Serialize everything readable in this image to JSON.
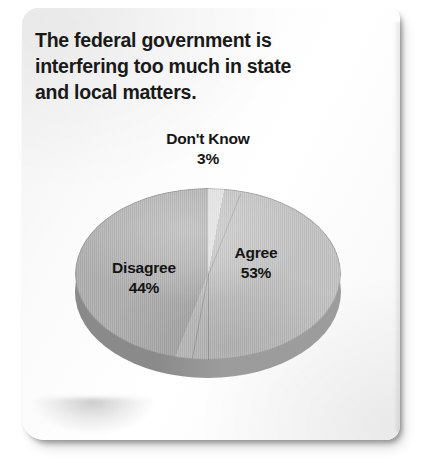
{
  "card": {
    "title_lines": [
      "The federal government is",
      "interfering too much in state",
      "and local matters."
    ]
  },
  "chart_data": {
    "type": "pie",
    "title": "The federal government is interfering too much in state and local matters.",
    "subtitle": "",
    "xlabel": "",
    "ylabel": "",
    "legend_position": "none",
    "grid": false,
    "three_d": true,
    "labels_inside": true,
    "categories": [
      "Don't Know",
      "Agree",
      "Disagree"
    ],
    "values": [
      3,
      53,
      44
    ],
    "value_suffix": "%",
    "slices": [
      {
        "name": "Don't Know",
        "label": "Don't Know",
        "value": 3,
        "value_label": "3%",
        "color": "#e2e2e2",
        "label_placement": "callout-above"
      },
      {
        "name": "Agree",
        "label": "Agree",
        "value": 53,
        "value_label": "53%",
        "color": "#c3c3c3",
        "label_placement": "inside-right"
      },
      {
        "name": "Disagree",
        "label": "Disagree",
        "value": 44,
        "value_label": "44%",
        "color": "#afafaf",
        "label_placement": "inside-left"
      }
    ],
    "depth_colors": {
      "left": "#8a8a8a",
      "right": "#9c9c9c"
    },
    "start_angle_deg": 0,
    "direction": "clockwise",
    "total": 100
  }
}
